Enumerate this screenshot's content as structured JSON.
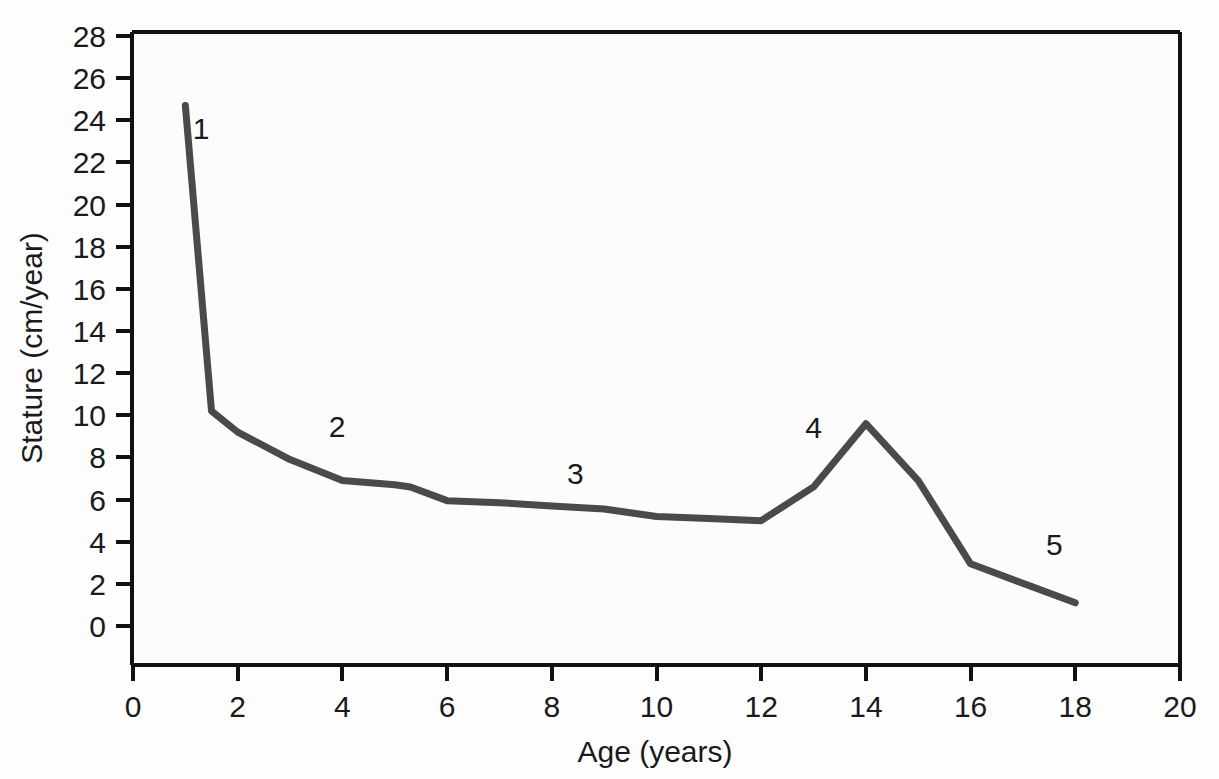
{
  "chart_data": {
    "type": "line",
    "title": "",
    "xlabel": "Age (years)",
    "ylabel": "Stature (cm/year)",
    "xlim": [
      0,
      20
    ],
    "ylim": [
      0,
      28
    ],
    "xticks": [
      0,
      2,
      4,
      6,
      8,
      10,
      12,
      14,
      16,
      18,
      20
    ],
    "ytickvals": [
      0,
      2,
      4,
      6,
      8,
      10,
      12,
      14,
      16,
      18,
      20,
      22,
      24,
      26,
      28
    ],
    "xtick_labels": [
      "0",
      "2",
      "4",
      "6",
      "8",
      "10",
      "12",
      "14",
      "16",
      "18",
      "20"
    ],
    "ytick_labels": [
      "0",
      "2",
      "4",
      "6",
      "8",
      "10",
      "12",
      "14",
      "16",
      "18",
      "20",
      "22",
      "24",
      "26",
      "28"
    ],
    "grid": false,
    "legend": "none",
    "line_color": "#4a4a4a",
    "line_width": 7,
    "axis_color": "#111111",
    "background_color": "#fdfdfd",
    "series": [
      {
        "name": "Growth velocity",
        "x": [
          1.0,
          1.5,
          2.0,
          3.0,
          4.0,
          5.0,
          5.3,
          6.0,
          7.0,
          8.0,
          9.0,
          10.0,
          11.0,
          12.0,
          13.0,
          14.0,
          15.0,
          16.0,
          18.0
        ],
        "values": [
          24.7,
          10.2,
          9.2,
          7.9,
          6.9,
          6.7,
          6.6,
          5.95,
          5.85,
          5.7,
          5.55,
          5.2,
          5.1,
          5.0,
          6.6,
          9.6,
          6.9,
          2.95,
          1.1
        ]
      }
    ],
    "annotations": [
      {
        "label": "1",
        "x": 1.3,
        "y": 23.1
      },
      {
        "label": "2",
        "x": 3.9,
        "y": 8.95
      },
      {
        "label": "3",
        "x": 8.45,
        "y": 6.75
      },
      {
        "label": "4",
        "x": 13.0,
        "y": 8.9
      },
      {
        "label": "5",
        "x": 17.6,
        "y": 3.35
      }
    ]
  },
  "axis": {
    "x_title": "Age (years)",
    "y_title": "Stature (cm/year)"
  }
}
